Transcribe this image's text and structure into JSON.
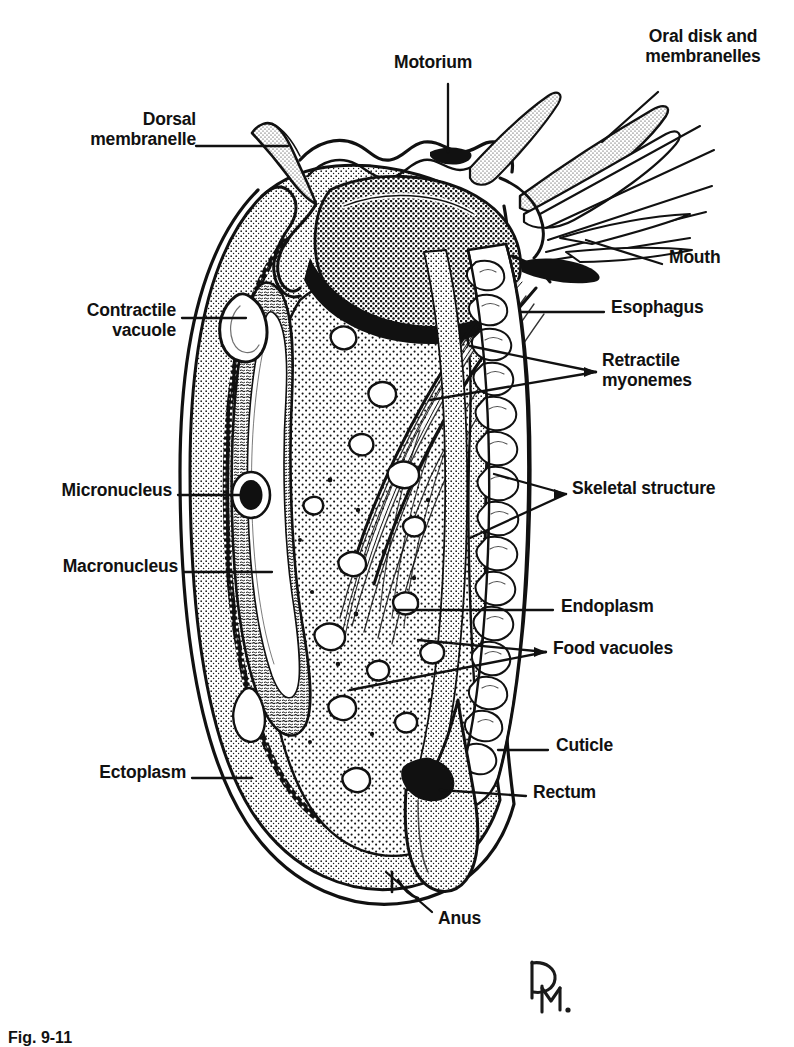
{
  "figure": {
    "caption": "Fig. 9-11",
    "signature": "DM.",
    "background_color": "#ffffff",
    "ink_color": "#111111"
  },
  "labels": [
    {
      "id": "dorsal-membranelle",
      "text": "Dorsal\nmembranelle",
      "side": "left",
      "align": "right",
      "x": 60,
      "y": 116
    },
    {
      "id": "contractile-vacuole",
      "text": "Contractile\nvacuole",
      "side": "left",
      "align": "right",
      "x": 46,
      "y": 306
    },
    {
      "id": "micronucleus",
      "text": "Micronucleus",
      "side": "left",
      "align": "right",
      "x": 36,
      "y": 487
    },
    {
      "id": "macronucleus",
      "text": "Macronucleus",
      "side": "left",
      "align": "right",
      "x": 32,
      "y": 562
    },
    {
      "id": "ectoplasm",
      "text": "Ectoplasm",
      "side": "left",
      "align": "right",
      "x": 82,
      "y": 768
    },
    {
      "id": "motorium",
      "text": "Motorium",
      "side": "top",
      "align": "left",
      "x": 394,
      "y": 59
    },
    {
      "id": "oral-disk",
      "text": "Oral disk and\nmembranelles",
      "side": "top",
      "align": "left",
      "x": 629,
      "y": 32
    },
    {
      "id": "mouth",
      "text": "Mouth",
      "side": "right",
      "align": "left",
      "x": 669,
      "y": 254
    },
    {
      "id": "esophagus",
      "text": "Esophagus",
      "side": "right",
      "align": "left",
      "x": 611,
      "y": 302
    },
    {
      "id": "retractile-myonemes",
      "text": "Retractile\nmyonemes",
      "side": "right",
      "align": "left",
      "x": 602,
      "y": 356
    },
    {
      "id": "skeletal-structure",
      "text": "Skeletal structure",
      "side": "right",
      "align": "left",
      "x": 572,
      "y": 484
    },
    {
      "id": "endoplasm",
      "text": "Endoplasm",
      "side": "right",
      "align": "left",
      "x": 561,
      "y": 601
    },
    {
      "id": "food-vacuoles",
      "text": "Food vacuoles",
      "side": "right",
      "align": "left",
      "x": 553,
      "y": 642
    },
    {
      "id": "cuticle",
      "text": "Cuticle",
      "side": "right",
      "align": "left",
      "x": 556,
      "y": 740
    },
    {
      "id": "rectum",
      "text": "Rectum",
      "side": "right",
      "align": "left",
      "x": 533,
      "y": 787
    },
    {
      "id": "anus",
      "text": "Anus",
      "side": "bottom",
      "align": "left",
      "x": 438,
      "y": 915
    }
  ]
}
